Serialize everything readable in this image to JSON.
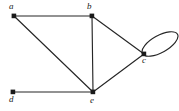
{
  "figure": {
    "type": "undirected-graph-diagram",
    "width": 179,
    "height": 111,
    "background_color": "#ffffff",
    "stroke_color": "#262626",
    "vertex_color": "#1a1a1a",
    "label_color": "#1a1a1a"
  },
  "graph_data": {
    "type": "graph",
    "directed": false,
    "vertex_count": 5,
    "edge_count": 7,
    "vertices": [
      {
        "id": "a",
        "label": "a",
        "x": 14,
        "y": 16,
        "label_x": 9,
        "label_y": 2
      },
      {
        "id": "b",
        "label": "b",
        "x": 92,
        "y": 16,
        "label_x": 87,
        "label_y": 2
      },
      {
        "id": "c",
        "label": "c",
        "x": 144,
        "y": 54,
        "label_x": 142,
        "label_y": 56
      },
      {
        "id": "d",
        "label": "d",
        "x": 13,
        "y": 92,
        "label_x": 9,
        "label_y": 95
      },
      {
        "id": "e",
        "label": "e",
        "x": 93,
        "y": 92,
        "label_x": 90,
        "label_y": 96
      }
    ],
    "edges": [
      {
        "from": "a",
        "to": "b"
      },
      {
        "from": "a",
        "to": "e"
      },
      {
        "from": "b",
        "to": "e"
      },
      {
        "from": "b",
        "to": "c"
      },
      {
        "from": "c",
        "to": "e"
      },
      {
        "from": "d",
        "to": "e"
      },
      {
        "from": "c",
        "to": "c",
        "kind": "self-loop"
      }
    ],
    "degrees": {
      "a": 2,
      "b": 3,
      "c": 4,
      "d": 1,
      "e": 4
    }
  }
}
